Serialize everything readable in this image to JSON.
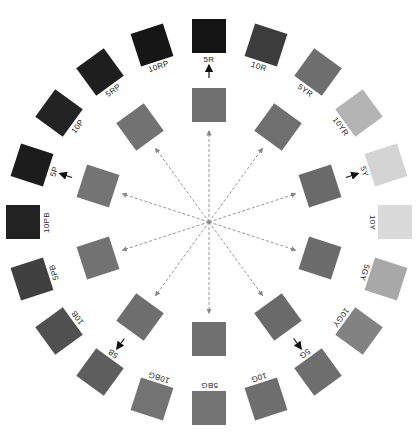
{
  "diagram": {
    "type": "hue-circle",
    "center": [
      209,
      222
    ],
    "outer_radius": 186,
    "inner_radius": 117,
    "chip_size": 34,
    "outer_ring": [
      {
        "label": "5R",
        "angle": 0,
        "color": "#141414"
      },
      {
        "label": "10R",
        "angle": 18,
        "color": "#3c3c3c"
      },
      {
        "label": "5YR",
        "angle": 36,
        "color": "#6e6e6e"
      },
      {
        "label": "10YR",
        "angle": 54,
        "color": "#b4b4b4"
      },
      {
        "label": "5Y",
        "angle": 72,
        "color": "#d4d4d4"
      },
      {
        "label": "10Y",
        "angle": 90,
        "color": "#dadada"
      },
      {
        "label": "5GY",
        "angle": 108,
        "color": "#a8a8a8"
      },
      {
        "label": "10GY",
        "angle": 126,
        "color": "#828282"
      },
      {
        "label": "5G",
        "angle": 144,
        "color": "#6e6e6e"
      },
      {
        "label": "10G",
        "angle": 162,
        "color": "#6e6e6e"
      },
      {
        "label": "5BG",
        "angle": 180,
        "color": "#737373"
      },
      {
        "label": "10BG",
        "angle": 198,
        "color": "#737373"
      },
      {
        "label": "5B",
        "angle": 216,
        "color": "#5e5e5e"
      },
      {
        "label": "10B",
        "angle": 234,
        "color": "#505050"
      },
      {
        "label": "5PB",
        "angle": 252,
        "color": "#404040"
      },
      {
        "label": "10PB",
        "angle": 270,
        "color": "#222222"
      },
      {
        "label": "5P",
        "angle": 288,
        "color": "#1c1c1c"
      },
      {
        "label": "10P",
        "angle": 306,
        "color": "#232323"
      },
      {
        "label": "5RP",
        "angle": 324,
        "color": "#1e1e1e"
      },
      {
        "label": "10RP",
        "angle": 342,
        "color": "#161616"
      }
    ],
    "inner_ring": [
      {
        "angle": 0,
        "color": "#6f6f6f",
        "arrow_out": true
      },
      {
        "angle": 36,
        "color": "#6f6f6f",
        "arrow_out": false
      },
      {
        "angle": 72,
        "color": "#6a6a6a",
        "arrow_out": true
      },
      {
        "angle": 108,
        "color": "#6c6c6c",
        "arrow_out": false
      },
      {
        "angle": 144,
        "color": "#6a6a6a",
        "arrow_out": true
      },
      {
        "angle": 180,
        "color": "#707070",
        "arrow_out": false
      },
      {
        "angle": 216,
        "color": "#6e6e6e",
        "arrow_out": true
      },
      {
        "angle": 252,
        "color": "#727272",
        "arrow_out": false
      },
      {
        "angle": 288,
        "color": "#747474",
        "arrow_out": true
      },
      {
        "angle": 324,
        "color": "#727272",
        "arrow_out": false
      }
    ]
  }
}
